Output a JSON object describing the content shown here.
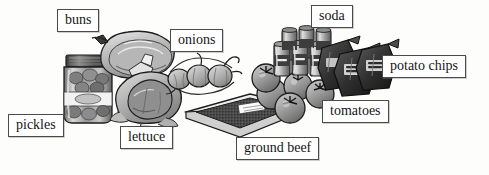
{
  "scene": {
    "title": "Grocery items picture vocabulary diagram",
    "background_color": "#fdfdfc",
    "label_border_color": "#4a4a4a",
    "label_text_color": "#151515",
    "width": 489,
    "height": 175
  },
  "labels": [
    {
      "id": "pickles",
      "text": "pickles",
      "x": 8,
      "y": 114
    },
    {
      "id": "buns",
      "text": "buns",
      "x": 57,
      "y": 9
    },
    {
      "id": "lettuce",
      "text": "lettuce",
      "x": 120,
      "y": 126
    },
    {
      "id": "onions",
      "text": "onions",
      "x": 170,
      "y": 29
    },
    {
      "id": "ground-beef",
      "text": "ground beef",
      "x": 236,
      "y": 137
    },
    {
      "id": "tomatoes",
      "text": "tomatoes",
      "x": 322,
      "y": 100
    },
    {
      "id": "soda",
      "text": "soda",
      "x": 311,
      "y": 5
    },
    {
      "id": "potato-chips",
      "text": "potato chips",
      "x": 382,
      "y": 55
    }
  ],
  "items": [
    {
      "id": "pickle-jar",
      "name": "jar of pickles"
    },
    {
      "id": "bun-bag",
      "name": "package of hamburger buns"
    },
    {
      "id": "lettuce-head",
      "name": "head of lettuce"
    },
    {
      "id": "onion-string",
      "name": "string of onions"
    },
    {
      "id": "beef-tray",
      "name": "tray of ground beef"
    },
    {
      "id": "tomato-pile",
      "name": "pile of tomatoes"
    },
    {
      "id": "soda-sixpack",
      "name": "six pack of soda cans"
    },
    {
      "id": "chip-bags",
      "name": "bags of potato chips"
    }
  ]
}
